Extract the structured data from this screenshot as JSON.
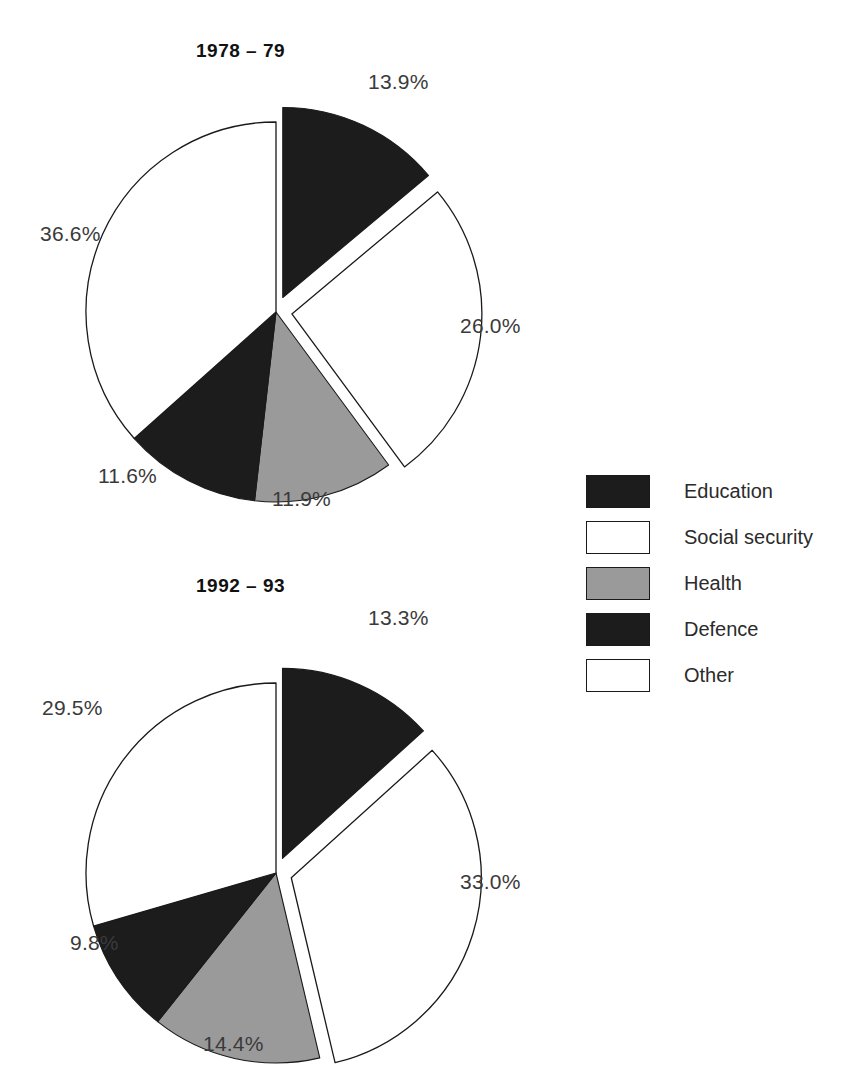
{
  "chart_data": [
    {
      "type": "pie",
      "title": "1978 – 79",
      "categories": [
        "Education",
        "Social security",
        "Health",
        "Defence",
        "Other"
      ],
      "values": [
        13.9,
        26.0,
        11.9,
        11.6,
        36.6
      ],
      "labels": [
        "13.9%",
        "26.0%",
        "11.9%",
        "11.6%",
        "36.6%"
      ],
      "colors": [
        "#1c1c1c",
        "#ffffff",
        "#9a9a9a",
        "#1c1c1c",
        "#ffffff"
      ],
      "exploded": [
        true,
        true,
        false,
        false,
        false
      ],
      "start_angle_deg": 0,
      "direction": "clockwise",
      "legend_position": "right",
      "xlabel": "",
      "ylabel": ""
    },
    {
      "type": "pie",
      "title": "1992 – 93",
      "categories": [
        "Education",
        "Social security",
        "Health",
        "Defence",
        "Other"
      ],
      "values": [
        13.3,
        33.0,
        14.4,
        9.8,
        29.5
      ],
      "labels": [
        "13.3%",
        "33.0%",
        "14.4%",
        "9.8%",
        "29.5%"
      ],
      "colors": [
        "#1c1c1c",
        "#ffffff",
        "#9a9a9a",
        "#1c1c1c",
        "#ffffff"
      ],
      "exploded": [
        true,
        true,
        false,
        false,
        false
      ],
      "start_angle_deg": 0,
      "direction": "clockwise",
      "legend_position": "right",
      "xlabel": "",
      "ylabel": ""
    }
  ],
  "charts": {
    "top": {
      "title": "1978 – 79",
      "slices": [
        {
          "name": "Education",
          "label": "13.9%",
          "value": 13.9,
          "fill": "#1c1c1c",
          "exploded": true
        },
        {
          "name": "Social security",
          "label": "26.0%",
          "value": 26.0,
          "fill": "#ffffff",
          "exploded": true
        },
        {
          "name": "Health",
          "label": "11.9%",
          "value": 11.9,
          "fill": "#9a9a9a",
          "exploded": false
        },
        {
          "name": "Defence",
          "label": "11.6%",
          "value": 11.6,
          "fill": "#1c1c1c",
          "exploded": false
        },
        {
          "name": "Other",
          "label": "36.6%",
          "value": 36.6,
          "fill": "#ffffff",
          "exploded": false
        }
      ]
    },
    "bottom": {
      "title": "1992 – 93",
      "slices": [
        {
          "name": "Education",
          "label": "13.3%",
          "value": 13.3,
          "fill": "#1c1c1c",
          "exploded": true
        },
        {
          "name": "Social security",
          "label": "33.0%",
          "value": 33.0,
          "fill": "#ffffff",
          "exploded": true
        },
        {
          "name": "Health",
          "label": "14.4%",
          "value": 14.4,
          "fill": "#9a9a9a",
          "exploded": false
        },
        {
          "name": "Defence",
          "label": "9.8%",
          "value": 9.8,
          "fill": "#1c1c1c",
          "exploded": false
        },
        {
          "name": "Other",
          "label": "29.5%",
          "value": 29.5,
          "fill": "#ffffff",
          "exploded": false
        }
      ]
    }
  },
  "legend": {
    "items": [
      {
        "label": "Education",
        "swatch": "#1c1c1c"
      },
      {
        "label": "Social security",
        "swatch": "#ffffff"
      },
      {
        "label": "Health",
        "swatch": "#9a9a9a"
      },
      {
        "label": "Defence",
        "swatch": "#1c1c1c"
      },
      {
        "label": "Other",
        "swatch": "#ffffff"
      }
    ]
  },
  "style": {
    "stroke": "#1a1a1a",
    "background": "#ffffff"
  }
}
